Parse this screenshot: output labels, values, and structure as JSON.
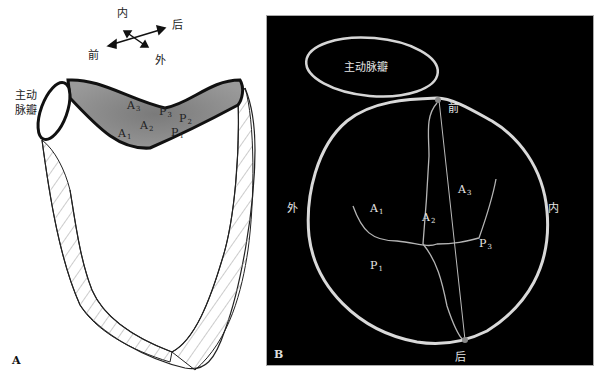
{
  "panel_a": {
    "letter": "A",
    "orientation": {
      "inner": "内",
      "posterior": "后",
      "anterior": "前",
      "outer": "外"
    },
    "aortic_valve_label_line1": "主动",
    "aortic_valve_label_line2": "脉瓣",
    "segments": [
      {
        "base": "A",
        "sub": "3"
      },
      {
        "base": "P",
        "sub": "3"
      },
      {
        "base": "P",
        "sub": "2"
      },
      {
        "base": "A",
        "sub": "2"
      },
      {
        "base": "A",
        "sub": "1"
      },
      {
        "base": "P",
        "sub": "1"
      }
    ],
    "colors": {
      "leaflet_fill": "#8c8c8c",
      "outline": "#111111",
      "hatch": "#999999"
    }
  },
  "panel_b": {
    "letter": "B",
    "aortic_valve_label": "主动脉瓣",
    "orientation": {
      "anterior": "前",
      "posterior": "后",
      "outer": "外",
      "inner": "内"
    },
    "segments": [
      {
        "base": "A",
        "sub": "1"
      },
      {
        "base": "A",
        "sub": "2"
      },
      {
        "base": "A",
        "sub": "3"
      },
      {
        "base": "P",
        "sub": "1"
      },
      {
        "base": "P",
        "sub": "3"
      }
    ],
    "colors": {
      "background": "#000000",
      "ring": "#d9d9d9",
      "lines": "#b5b5b5"
    }
  }
}
